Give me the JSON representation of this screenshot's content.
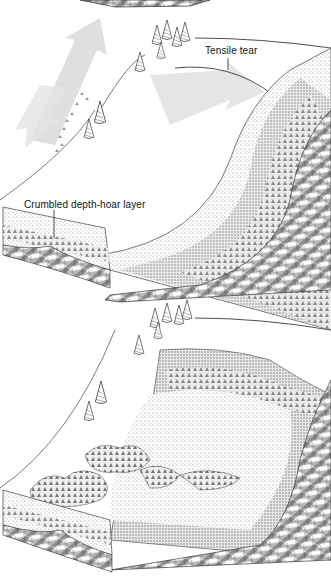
{
  "figure": {
    "panels": [
      {
        "id": "top",
        "description": "Slab releasing along a tensile tear above a crumbled depth-hoar layer",
        "labels": {
          "tensile_tear": "Tensile tear",
          "depth_hoar": "Crumbled depth-hoar layer"
        }
      },
      {
        "id": "bottom",
        "description": "Slope after release, with slab debris accumulated at the base"
      }
    ]
  },
  "colors": {
    "line": "#222222",
    "arrow": "#d9d9d9",
    "snow_stipple": "#9a9a9a",
    "rock_hatch": "#333333",
    "background": "#ffffff"
  }
}
